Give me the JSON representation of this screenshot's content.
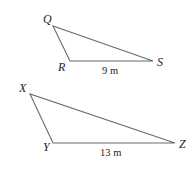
{
  "diagram": {
    "type": "similar-triangles",
    "triangles": [
      {
        "id": "QRS",
        "vertices": {
          "Q": {
            "label": "Q",
            "x": 53,
            "y": 26
          },
          "R": {
            "label": "R",
            "x": 70,
            "y": 61
          },
          "S": {
            "label": "S",
            "x": 153,
            "y": 61
          }
        },
        "side_label": {
          "side": "RS",
          "text": "9 m"
        }
      },
      {
        "id": "XYZ",
        "vertices": {
          "X": {
            "label": "X",
            "x": 30,
            "y": 94
          },
          "Y": {
            "label": "Y",
            "x": 53,
            "y": 143
          },
          "Z": {
            "label": "Z",
            "x": 175,
            "y": 143
          }
        },
        "side_label": {
          "side": "YZ",
          "text": "13 m"
        }
      }
    ],
    "colors": {
      "stroke": "#6a6a6a",
      "text": "#222222"
    }
  }
}
